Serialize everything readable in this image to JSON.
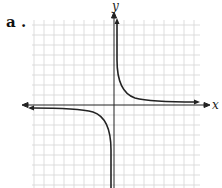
{
  "problem": {
    "label": "a ."
  },
  "axes": {
    "x_label": "x",
    "y_label": "y"
  },
  "graph": {
    "type": "hyperbola",
    "description": "Graph of y = k/x with vertical asymptote x=0 and horizontal asymptote y=0; branches in quadrants I and III",
    "grid_color": "#d0d0d0",
    "curve_color": "#222222"
  }
}
